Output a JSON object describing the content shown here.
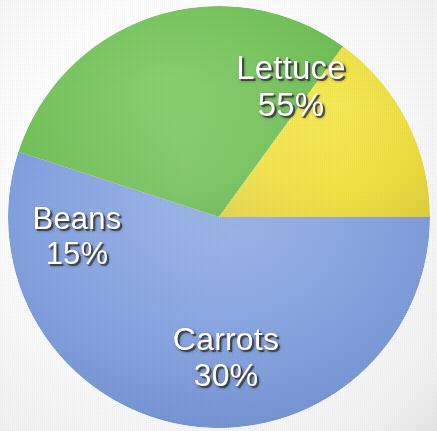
{
  "figure": {
    "name": "vegetable-garden-pie-chart",
    "background_color": "#ffffff"
  },
  "chart_data": {
    "type": "pie",
    "title": "",
    "subtitle": "",
    "xlabel": "",
    "ylabel": "",
    "legend_position": "none",
    "grid": false,
    "labels_inside_slices": true,
    "value_suffix": "%",
    "total": 100,
    "start_angle_deg": 0,
    "direction": "clockwise",
    "categories": [
      "Lettuce",
      "Carrots",
      "Beans"
    ],
    "values": [
      55,
      30,
      15
    ],
    "colors": [
      "#7f9fe0",
      "#6dbf52",
      "#f2e23c"
    ],
    "slices": [
      {
        "name": "Lettuce",
        "value": 55,
        "value_text": "55%",
        "color": "#7f9fe0",
        "color_name": "periwinkle-blue",
        "start_angle_deg": 0,
        "end_angle_deg": 198
      },
      {
        "name": "Carrots",
        "value": 30,
        "value_text": "30%",
        "color": "#6dbf52",
        "color_name": "green",
        "start_angle_deg": 198,
        "end_angle_deg": 306
      },
      {
        "name": "Beans",
        "value": 15,
        "value_text": "15%",
        "color": "#f2e23c",
        "color_name": "yellow",
        "start_angle_deg": 306,
        "end_angle_deg": 360
      }
    ]
  },
  "labels": {
    "lettuce": {
      "name": "Lettuce",
      "value": "55%"
    },
    "carrots": {
      "name": "Carrots",
      "value": "30%"
    },
    "beans": {
      "name": "Beans",
      "value": "15%"
    }
  }
}
